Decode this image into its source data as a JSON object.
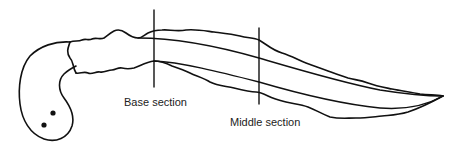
{
  "diagram": {
    "type": "anatomical line drawing",
    "labels": {
      "base_section": "Base section",
      "middle_section": "Middle section"
    },
    "colors": {
      "stroke": "#111111",
      "background": "#ffffff",
      "text": "#222222"
    }
  }
}
